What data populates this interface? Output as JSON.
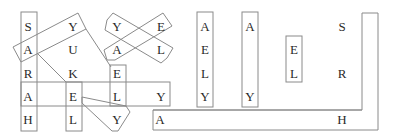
{
  "puzzle": {
    "type": "word-search",
    "line_color": "#8a8a8a",
    "text_color": "#2a2a2a",
    "letters": [
      {
        "ch": "S",
        "x": 28,
        "y": 27
      },
      {
        "ch": "A",
        "x": 28,
        "y": 50
      },
      {
        "ch": "R",
        "x": 28,
        "y": 74
      },
      {
        "ch": "A",
        "x": 28,
        "y": 97
      },
      {
        "ch": "H",
        "x": 28,
        "y": 120
      },
      {
        "ch": "Y",
        "x": 73,
        "y": 27
      },
      {
        "ch": "U",
        "x": 73,
        "y": 50
      },
      {
        "ch": "K",
        "x": 73,
        "y": 74
      },
      {
        "ch": "E",
        "x": 73,
        "y": 97
      },
      {
        "ch": "L",
        "x": 73,
        "y": 120
      },
      {
        "ch": "Y",
        "x": 117,
        "y": 27
      },
      {
        "ch": "A",
        "x": 117,
        "y": 50
      },
      {
        "ch": "E",
        "x": 117,
        "y": 74
      },
      {
        "ch": "L",
        "x": 117,
        "y": 97
      },
      {
        "ch": "Y",
        "x": 117,
        "y": 120
      },
      {
        "ch": "E",
        "x": 161,
        "y": 27
      },
      {
        "ch": "L",
        "x": 161,
        "y": 50
      },
      {
        "ch": "Y",
        "x": 161,
        "y": 97
      },
      {
        "ch": "A",
        "x": 160,
        "y": 120
      },
      {
        "ch": "A",
        "x": 205,
        "y": 27
      },
      {
        "ch": "E",
        "x": 205,
        "y": 50
      },
      {
        "ch": "L",
        "x": 205,
        "y": 74
      },
      {
        "ch": "Y",
        "x": 205,
        "y": 97
      },
      {
        "ch": "A",
        "x": 250,
        "y": 27
      },
      {
        "ch": "Y",
        "x": 250,
        "y": 97
      },
      {
        "ch": "E",
        "x": 294,
        "y": 50
      },
      {
        "ch": "L",
        "x": 294,
        "y": 74
      },
      {
        "ch": "S",
        "x": 342,
        "y": 27
      },
      {
        "ch": "R",
        "x": 342,
        "y": 74
      },
      {
        "ch": "H",
        "x": 342,
        "y": 120
      }
    ],
    "words_found": [
      "SARAH",
      "AUKEL",
      "YUKEL",
      "AELY",
      "YE",
      "AL",
      "ELY",
      "EL",
      "AY",
      "SRH"
    ]
  }
}
